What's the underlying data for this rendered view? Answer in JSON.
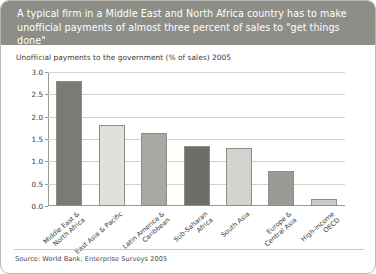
{
  "figure": {
    "title": "A typical firm in a Middle East and North Africa country has to make unofficial payments of almost three percent of sales to \"get things done\"",
    "source": "Source: World Bank, Enterprise Surveys 2005",
    "title_bg_color": "#8e8e88",
    "title_text_color": "#ffffff",
    "border_color": "#b8b8b2"
  },
  "chart_data": {
    "type": "bar",
    "title": "Unofficial payments to the government (% of sales) 2005",
    "xlabel": "",
    "ylabel": "",
    "ylim": [
      0,
      3.0
    ],
    "yticks": [
      "0.0",
      "0.5",
      "1.0",
      "1.5",
      "2.0",
      "2.5",
      "3.0"
    ],
    "ytick_values": [
      0,
      0.5,
      1.0,
      1.5,
      2.0,
      2.5,
      3.0
    ],
    "grid": true,
    "legend": "none",
    "categories": [
      "Middle East & North Africa",
      "East Asia & Pacific",
      "Latin America & Caribbean",
      "Sub-Saharan Africa",
      "South Asia",
      "Europe & Central Asia",
      "High-income OECD"
    ],
    "category_lines": [
      [
        "Middle East &",
        "North Africa"
      ],
      [
        "East Asia & Pacific"
      ],
      [
        "Latin America &",
        "Caribbean"
      ],
      [
        "Sub-Saharan",
        "Africa"
      ],
      [
        "South Asia"
      ],
      [
        "Europe &",
        "Central Asia"
      ],
      [
        "High-income",
        "OECD"
      ]
    ],
    "values": [
      2.8,
      1.82,
      1.63,
      1.35,
      1.3,
      0.78,
      0.15
    ],
    "bar_colors": [
      "#7b7b76",
      "#e0e0dc",
      "#a9a9a4",
      "#6e6e69",
      "#d3d3cf",
      "#9b9b96",
      "#c9c9c5"
    ]
  }
}
